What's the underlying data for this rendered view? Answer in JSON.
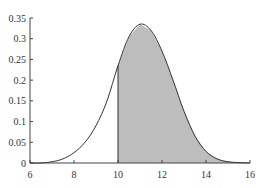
{
  "chart_data": {
    "type": "area",
    "title": "",
    "xlabel": "",
    "ylabel": "",
    "xlim": [
      6,
      16
    ],
    "ylim": [
      0,
      0.35
    ],
    "grid": false,
    "x_ticks": [
      "6",
      "8",
      "10",
      "12",
      "14",
      "16"
    ],
    "y_ticks": [
      "0",
      "0.05",
      "0.1",
      "0.15",
      "0.2",
      "0.25",
      "0.3",
      "0.35"
    ],
    "shaded_from": 10,
    "shade_color": "#bdbdbd",
    "x": [
      6.5,
      7,
      7.5,
      8,
      8.5,
      9,
      9.5,
      10,
      10.5,
      11,
      11.5,
      12,
      12.5,
      13,
      13.5,
      14,
      14.5,
      15,
      15.5,
      16
    ],
    "values": [
      0.0,
      0.003,
      0.01,
      0.025,
      0.05,
      0.09,
      0.15,
      0.235,
      0.305,
      0.335,
      0.32,
      0.27,
      0.2,
      0.125,
      0.065,
      0.028,
      0.01,
      0.003,
      0.001,
      0.0
    ]
  }
}
